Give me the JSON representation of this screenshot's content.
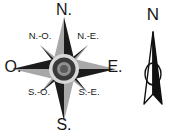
{
  "figure": {
    "type": "compass-rose-diagram",
    "background_color": "#ffffff"
  },
  "compass_rose": {
    "name": "eight-point-compass-rose",
    "hub": {
      "outer_ring_color": "#d9d9d9",
      "mid_ring_color": "#3a3a3a",
      "inner_color": "#8a8a8a"
    },
    "point_colors": {
      "light": "#a8a8a8",
      "dark": "#1c1c1c"
    },
    "labels": {
      "north": "N.",
      "northwest": "N.-O.",
      "northeast": "N.-E.",
      "west": "O.",
      "east": "E.",
      "southwest": "S.-O.",
      "southeast": "S.-E.",
      "south": "S."
    }
  },
  "north_arrow": {
    "name": "map-north-arrow",
    "label": "N",
    "fill_color": "#111111",
    "outline_color": "#111111"
  }
}
